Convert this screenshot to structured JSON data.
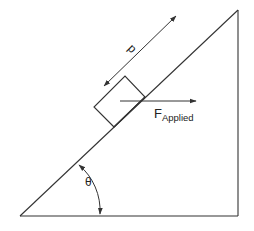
{
  "diagram": {
    "type": "inclined-plane-force-diagram",
    "labels": {
      "distance": "d",
      "force_main": "F",
      "force_sub": "Applied",
      "angle": "θ"
    },
    "colors": {
      "line": "#333333",
      "text": "#222222",
      "background": "#ffffff"
    },
    "elements": [
      "incline-triangle",
      "block",
      "applied-force-arrow",
      "distance-arrow",
      "angle-arc"
    ]
  }
}
